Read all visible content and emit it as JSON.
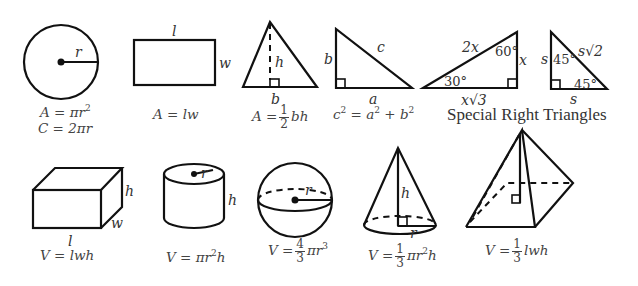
{
  "circle": {
    "label_r": "r",
    "formula_area": "A = πr",
    "formula_area_exp": "2",
    "formula_circ": "C = 2πr"
  },
  "rectangle": {
    "label_l": "l",
    "label_w": "w",
    "formula": "A = lw"
  },
  "triangle": {
    "label_h": "h",
    "label_b": "b",
    "formula_prefix": "A =",
    "frac_num": "1",
    "frac_den": "2",
    "formula_suffix": "bh"
  },
  "pythagorean": {
    "label_a": "a",
    "label_b": "b",
    "label_c": "c",
    "formula_c": "c",
    "formula_a": " = a",
    "formula_b": " + b",
    "exp": "2"
  },
  "special_30_60_90": {
    "label_hyp": "2x",
    "label_short": "x",
    "label_long": "x√3",
    "angle_small": "30°",
    "angle_large": "60°"
  },
  "special_45_45_90": {
    "label_leg_vertical": "s",
    "label_leg_horizontal": "s",
    "label_hyp": "s√2",
    "angle_top": "45°",
    "angle_bottom": "45°"
  },
  "special_caption": "Special Right Triangles",
  "prism": {
    "label_l": "l",
    "label_w": "w",
    "label_h": "h",
    "formula": "V = lwh"
  },
  "cylinder": {
    "label_r": "r",
    "label_h": "h",
    "formula_prefix": "V = πr",
    "exp": "2",
    "formula_suffix": "h"
  },
  "sphere": {
    "label_r": "r",
    "formula_prefix": "V =",
    "frac_num": "4",
    "frac_den": "3",
    "formula_suffix": "πr",
    "exp": "3"
  },
  "cone": {
    "label_h": "h",
    "label_r": "r",
    "formula_prefix": "V =",
    "frac_num": "1",
    "frac_den": "3",
    "formula_mid": "πr",
    "exp": "2",
    "formula_suffix": "h"
  },
  "pyramid": {
    "formula_prefix": "V =",
    "frac_num": "1",
    "frac_den": "3",
    "formula_suffix": "lwh"
  }
}
